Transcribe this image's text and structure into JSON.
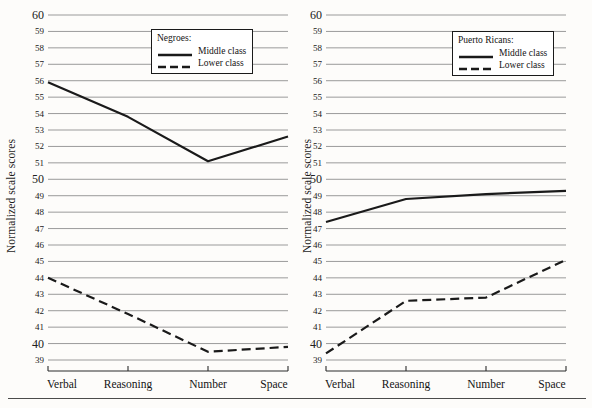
{
  "figure": {
    "ylabel": "Normalized scale scores",
    "background": "#fdfcfa",
    "gridline_color": "#9a9a9a",
    "line_color": "#1a1a1a",
    "axis_color": "#2b2b2b"
  },
  "chart_data": [
    {
      "type": "line",
      "title": "Negroes:",
      "panel": "left",
      "xlabel": "",
      "ylabel": "Normalized scale scores",
      "categories": [
        "Verbal",
        "Reasoning",
        "Number",
        "Space"
      ],
      "ylim": [
        39,
        60
      ],
      "yticks": [
        39,
        40,
        41,
        42,
        43,
        44,
        45,
        46,
        47,
        48,
        49,
        50,
        51,
        52,
        53,
        54,
        55,
        56,
        57,
        58,
        59,
        60
      ],
      "major_yticks": [
        40,
        50,
        60
      ],
      "grid": true,
      "legend_position": "upper-center",
      "series": [
        {
          "name": "Middle class",
          "style": "solid",
          "values": [
            55.9,
            53.8,
            51.1,
            52.6
          ]
        },
        {
          "name": "Lower class",
          "style": "dashed",
          "values": [
            44.0,
            41.8,
            39.5,
            39.8
          ]
        }
      ]
    },
    {
      "type": "line",
      "title": "Puerto Ricans:",
      "panel": "right",
      "xlabel": "",
      "ylabel": "Normalized scale scores",
      "categories": [
        "Verbal",
        "Reasoning",
        "Number",
        "Space"
      ],
      "ylim": [
        39,
        60
      ],
      "yticks": [
        39,
        40,
        41,
        42,
        43,
        44,
        45,
        46,
        47,
        48,
        49,
        50,
        51,
        52,
        53,
        54,
        55,
        56,
        57,
        58,
        59,
        60
      ],
      "major_yticks": [
        40,
        50,
        60
      ],
      "grid": true,
      "legend_position": "upper-center",
      "series": [
        {
          "name": "Middle class",
          "style": "solid",
          "values": [
            47.4,
            48.8,
            49.1,
            49.3
          ]
        },
        {
          "name": "Lower class",
          "style": "dashed",
          "values": [
            39.4,
            42.6,
            42.8,
            45.1
          ]
        }
      ]
    }
  ]
}
